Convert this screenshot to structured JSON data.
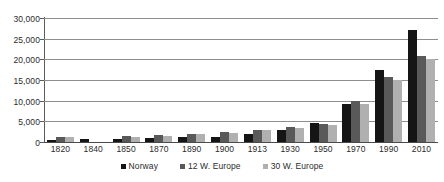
{
  "chart_data": {
    "type": "bar",
    "title": "",
    "subtitle": "",
    "xlabel": "",
    "ylabel": "",
    "ylim": [
      0,
      30000
    ],
    "ytick_labels": [
      "30,000",
      "25,000",
      "20,000",
      "15,000",
      "10,000",
      "5,000",
      "0"
    ],
    "yticks": [
      30000,
      25000,
      20000,
      15000,
      10000,
      5000,
      0
    ],
    "grid": true,
    "legend_position": "bottom-center",
    "categories": [
      "1820",
      "1840",
      "1850",
      "1870",
      "1890",
      "1900",
      "1913",
      "1930",
      "1950",
      "1970",
      "1990",
      "2010"
    ],
    "series": [
      {
        "name": "Norway",
        "color": "#151515",
        "values": [
          600,
          700,
          700,
          900,
          1200,
          1300,
          1900,
          2900,
          4600,
          9200,
          17500,
          27000
        ]
      },
      {
        "name": "12 W. Europe",
        "color": "#595959",
        "values": [
          1250,
          null,
          1350,
          1600,
          2000,
          2500,
          3000,
          3600,
          4300,
          9900,
          15800,
          20800
        ]
      },
      {
        "name": "30 W. Europe",
        "color": "#b0b0b0",
        "values": [
          1150,
          null,
          1250,
          1500,
          1900,
          2300,
          2800,
          3400,
          4100,
          9100,
          15000,
          20000
        ]
      }
    ]
  },
  "legend": {
    "items": [
      {
        "label": "Norway",
        "swatch": "s0"
      },
      {
        "label": "12 W. Europe",
        "swatch": "s1"
      },
      {
        "label": "30 W. Europe",
        "swatch": "s2"
      }
    ]
  }
}
